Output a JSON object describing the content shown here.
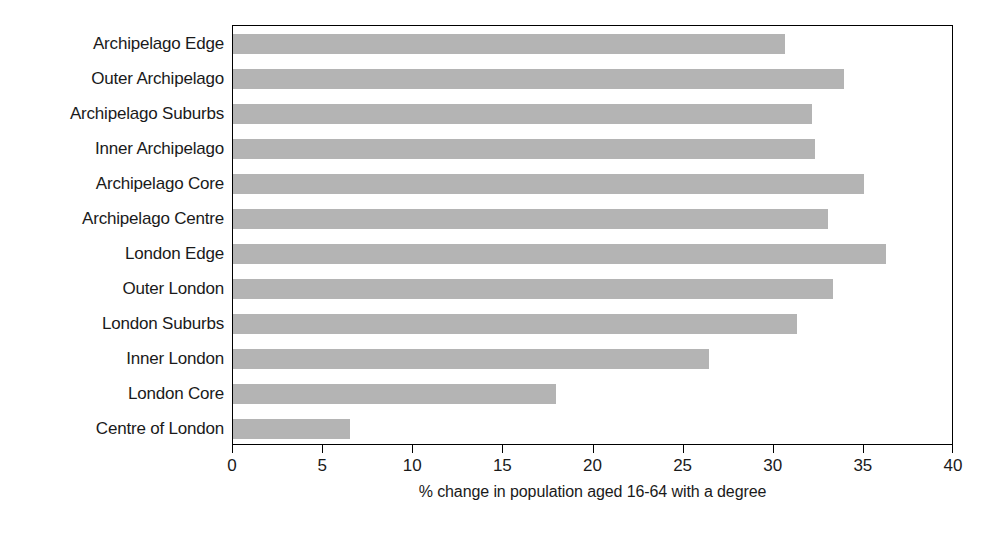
{
  "chart_data": {
    "type": "bar",
    "orientation": "horizontal",
    "title": "",
    "xlabel": "% change in population aged 16-64 with a degree",
    "ylabel": "",
    "xlim": [
      0,
      40
    ],
    "xticks": [
      0,
      5,
      10,
      15,
      20,
      25,
      30,
      35,
      40
    ],
    "xtick_labels": [
      "0",
      "5",
      "10",
      "15",
      "20",
      "25",
      "30",
      "35",
      "40"
    ],
    "grid": false,
    "legend": null,
    "bar_color": "#b4b4b4",
    "frame_color": "#000000",
    "categories": [
      "Archipelago Edge",
      "Outer Archipelago",
      "Archipelago Suburbs",
      "Inner Archipelago",
      "Archipelago Core",
      "Archipelago Centre",
      "London Edge",
      "Outer London",
      "London Suburbs",
      "Inner London",
      "London Core",
      "Centre of London"
    ],
    "values": [
      30.6,
      33.9,
      32.1,
      32.3,
      35.0,
      33.0,
      36.2,
      33.3,
      31.3,
      26.4,
      17.9,
      6.5
    ]
  }
}
